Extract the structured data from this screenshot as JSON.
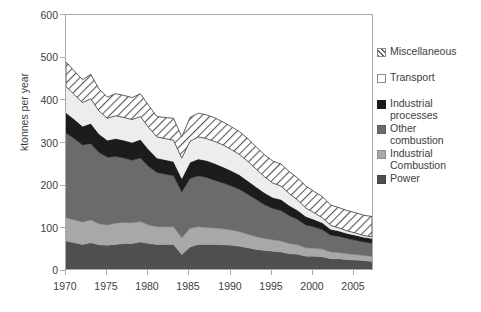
{
  "chart_data": {
    "type": "area",
    "stacked": true,
    "title": "",
    "subtitle": "",
    "xlabel": "",
    "ylabel": "ktonnes per year",
    "xlim": [
      1970,
      2007
    ],
    "ylim": [
      0,
      600
    ],
    "ytick_labels": [
      "0",
      "100",
      "200",
      "300",
      "400",
      "500",
      "600"
    ],
    "ytick_values": [
      0,
      100,
      200,
      300,
      400,
      500,
      600
    ],
    "xtick_labels": [
      "1970",
      "1975",
      "1980",
      "1985",
      "1990",
      "1995",
      "2000",
      "2005"
    ],
    "xtick_values": [
      1970,
      1975,
      1980,
      1985,
      1990,
      1995,
      2000,
      2005
    ],
    "grid": false,
    "legend_position": "right",
    "x": [
      1970,
      1971,
      1972,
      1973,
      1974,
      1975,
      1976,
      1977,
      1978,
      1979,
      1980,
      1981,
      1982,
      1983,
      1984,
      1985,
      1986,
      1987,
      1988,
      1989,
      1990,
      1991,
      1992,
      1993,
      1994,
      1995,
      1996,
      1997,
      1998,
      1999,
      2000,
      2001,
      2002,
      2003,
      2004,
      2005,
      2006,
      2007
    ],
    "stack_order_bottom_to_top": [
      "Power",
      "Industrial Combustion",
      "Other combustion",
      "Industrial processes",
      "Transport",
      "Miscellaneous"
    ],
    "series": [
      {
        "name": "Power",
        "color": "#4f4f4f",
        "pattern": "solid",
        "values": [
          66,
          62,
          58,
          62,
          57,
          56,
          58,
          60,
          60,
          64,
          60,
          58,
          58,
          58,
          34,
          52,
          58,
          58,
          58,
          57,
          56,
          54,
          50,
          46,
          44,
          42,
          40,
          36,
          35,
          30,
          30,
          29,
          24,
          24,
          22,
          21,
          20,
          18
        ]
      },
      {
        "name": "Industrial Combustion",
        "color": "#a8a8a8",
        "pattern": "solid",
        "values": [
          55,
          54,
          53,
          54,
          50,
          48,
          50,
          50,
          49,
          48,
          44,
          42,
          42,
          42,
          40,
          44,
          42,
          40,
          39,
          38,
          36,
          34,
          32,
          30,
          28,
          27,
          26,
          24,
          22,
          20,
          19,
          18,
          16,
          15,
          14,
          13,
          12,
          12
        ]
      },
      {
        "name": "Other combustion",
        "color": "#6b6b6b",
        "pattern": "solid",
        "values": [
          200,
          192,
          182,
          180,
          168,
          160,
          158,
          152,
          148,
          150,
          138,
          128,
          124,
          120,
          108,
          118,
          120,
          118,
          112,
          108,
          104,
          100,
          94,
          88,
          80,
          74,
          72,
          66,
          60,
          54,
          50,
          46,
          40,
          38,
          36,
          34,
          32,
          31
        ]
      },
      {
        "name": "Industrial processes",
        "color": "#1c1c1c",
        "pattern": "solid",
        "values": [
          48,
          46,
          44,
          48,
          44,
          40,
          42,
          42,
          42,
          44,
          40,
          34,
          34,
          34,
          32,
          38,
          40,
          40,
          40,
          38,
          36,
          34,
          32,
          30,
          28,
          26,
          26,
          24,
          22,
          20,
          18,
          16,
          14,
          13,
          12,
          12,
          11,
          11
        ]
      },
      {
        "name": "Transport",
        "color": "#ededed",
        "pattern": "solid",
        "values": [
          62,
          58,
          56,
          58,
          54,
          52,
          54,
          54,
          54,
          54,
          52,
          50,
          50,
          50,
          48,
          50,
          52,
          52,
          52,
          52,
          50,
          48,
          46,
          42,
          38,
          34,
          32,
          28,
          24,
          20,
          16,
          12,
          9,
          7,
          6,
          5,
          4,
          4
        ]
      },
      {
        "name": "Miscellaneous",
        "color": "#f2f2f2",
        "pattern": "diagonal-hatch",
        "values": [
          58,
          56,
          54,
          58,
          52,
          50,
          52,
          52,
          52,
          54,
          52,
          48,
          50,
          52,
          50,
          56,
          56,
          56,
          56,
          54,
          54,
          54,
          54,
          52,
          52,
          52,
          52,
          52,
          52,
          52,
          50,
          50,
          48,
          48,
          48,
          48,
          48,
          48
        ]
      }
    ],
    "totals": [
      489,
      468,
      447,
      460,
      425,
      406,
      414,
      410,
      405,
      414,
      386,
      360,
      358,
      356,
      312,
      358,
      368,
      364,
      357,
      347,
      336,
      324,
      308,
      288,
      270,
      255,
      248,
      230,
      215,
      196,
      183,
      171,
      151,
      145,
      138,
      133,
      127,
      124
    ]
  },
  "legend": {
    "items": [
      {
        "label_line1": "Miscellaneous",
        "label_line2": "",
        "swatch": "hatched-swatch",
        "color": "#f2f2f2"
      },
      {
        "label_line1": "Transport",
        "label_line2": "",
        "swatch": "white-swatch",
        "color": "#ffffff"
      },
      {
        "label_line1": "Industrial",
        "label_line2": "processes",
        "swatch": "near-black-swatch",
        "color": "#1c1c1c"
      },
      {
        "label_line1": "Other",
        "label_line2": "combustion",
        "swatch": "dark-grey-swatch",
        "color": "#6b6b6b"
      },
      {
        "label_line1": "Industrial",
        "label_line2": "Combustion",
        "swatch": "light-grey-swatch",
        "color": "#a8a8a8"
      },
      {
        "label_line1": "Power",
        "label_line2": "",
        "swatch": "medium-dark-grey-swatch",
        "color": "#4f4f4f"
      }
    ]
  },
  "axes": {
    "y_title": "ktonnes per year",
    "axis_color": "#a9a9a9",
    "text_color": "#404040"
  }
}
